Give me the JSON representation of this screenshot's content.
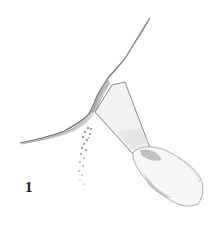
{
  "illustration": {
    "subject": "putty knife scraping loose material from a wall crack",
    "step_label": "1",
    "colors": {
      "background": "#ffffff",
      "line": "#6e6e6e",
      "shade_dark": "#8a8a8a",
      "shade_light": "#cfcfcf",
      "label": "#1a1a1a"
    }
  }
}
